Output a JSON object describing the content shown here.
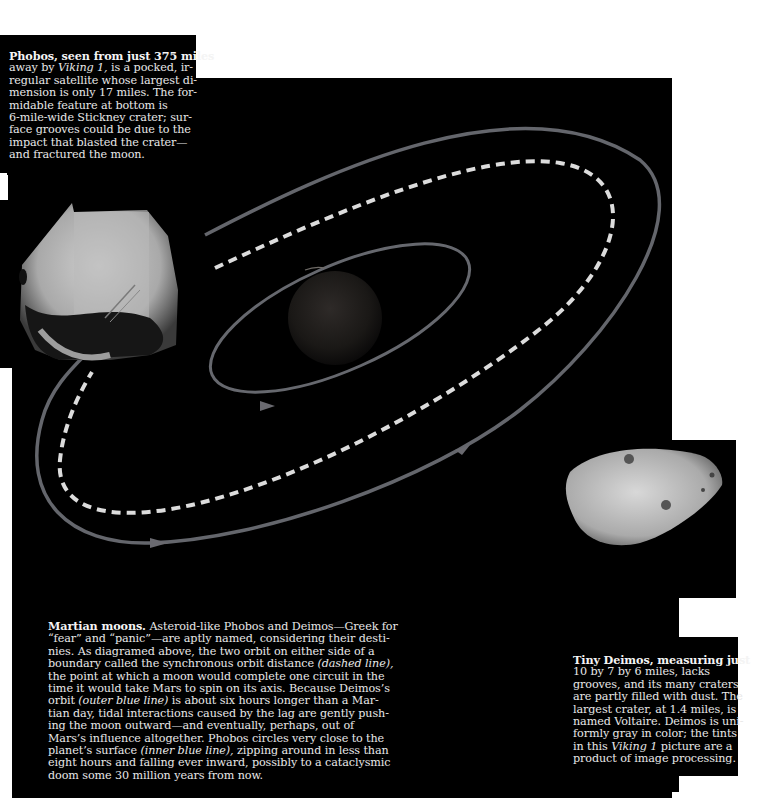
{
  "page": {
    "background": "#000000",
    "paper": "#ffffff",
    "orbit_color": "#6a6a70",
    "sync_orbit_color": "#d8d8d8"
  },
  "phobos_caption": {
    "lead": "Phobos, seen from just 375 miles",
    "lines": [
      "away by ",
      "regular satellite whose largest di-",
      "mension is only 17 miles. The for-",
      "midable feature at bottom is",
      "6-mile-wide Stickney crater; sur-",
      "face grooves could be due to the",
      "impact that blasted the crater—",
      "and fractured the moon."
    ],
    "line1_italic": "Viking 1,",
    "line1_tail": " is a pocked, ir-"
  },
  "diagram": {
    "labels": {
      "phobos_image": "Phobos photograph",
      "deimos_image": "Deimos photograph",
      "mars": "Mars",
      "inner_orbit": "inner blue line (Phobos orbit)",
      "outer_orbit": "outer blue line (Deimos orbit)",
      "sync_orbit": "dashed line (synchronous orbit distance)"
    }
  },
  "main_caption": {
    "lead": "Martian moons.",
    "l1": " Asteroid-like Phobos and Deimos—Greek for",
    "l2": "“fear” and “panic”—are aptly named, considering their desti-",
    "l3": "nies. As diagramed above, the two orbit on either side of a",
    "l4a": "boundary called the synchronous orbit distance ",
    "l4i": "(dashed line),",
    "l5": "the point at which a moon would complete one circuit in the",
    "l6": "time it would take Mars to spin on its axis. Because Deimos’s",
    "l7a": "orbit ",
    "l7i": "(outer blue line)",
    "l7b": " is about six hours longer than a Mar-",
    "l8": "tian day, tidal interactions caused by the lag are gently push-",
    "l9": "ing the moon outward—and eventually, perhaps, out of",
    "l10": "Mars’s influence altogether. Phobos circles very close to the",
    "l11a": "planet’s surface ",
    "l11i": "(inner blue line),",
    "l11b": " zipping around in less than",
    "l12": "eight hours and falling ever inward, possibly to a cataclysmic",
    "l13": "doom some 30 million years from now."
  },
  "deimos_caption": {
    "lead": "Tiny Deimos, measuring just",
    "l1": "10 by 7 by 6 miles, lacks",
    "l2": "grooves, and its many craters",
    "l3": "are partly filled with dust. The",
    "l4": "largest crater, at 1.4 miles, is",
    "l5": "named Voltaire. Deimos is uni-",
    "l6": "formly gray in color; the tints",
    "l7a": "in this ",
    "l7i": "Viking 1",
    "l7b": " picture are a",
    "l8": "product of image processing."
  }
}
